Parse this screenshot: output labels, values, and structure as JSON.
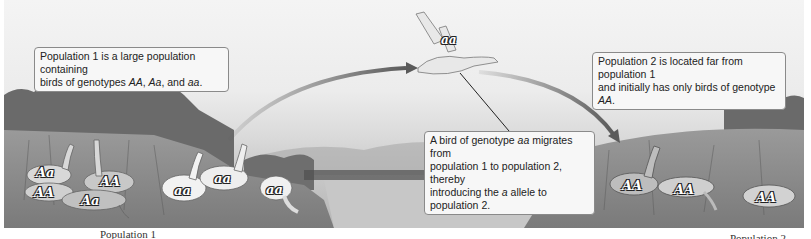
{
  "callouts": {
    "population1": {
      "line1": "Population 1 is a large population containing",
      "line2_prefix": "birds of genotypes ",
      "g1": "AA",
      "sep1": ", ",
      "g2": "Aa",
      "sep2": ", and ",
      "g3": "aa",
      "end": "."
    },
    "population2": {
      "line1": "Population 2 is located far from population 1",
      "line2_prefix": "and initially has only birds of genotype ",
      "g1": "AA",
      "end": "."
    },
    "migration": {
      "line1_prefix": "A bird of genotype ",
      "g1": "aa",
      "line1_suffix": " migrates from",
      "line2": "population 1 to population 2, thereby",
      "line3_prefix": "introducing the ",
      "allele": "a",
      "line3_suffix": " allele to population 2."
    }
  },
  "birds": {
    "flying": {
      "genotype": "aa"
    },
    "population1": [
      {
        "genotype": "Aa"
      },
      {
        "genotype": "AA"
      },
      {
        "genotype": "AA"
      },
      {
        "genotype": "Aa"
      },
      {
        "genotype": "aa"
      },
      {
        "genotype": "aa"
      },
      {
        "genotype": "aa"
      }
    ],
    "population2": [
      {
        "genotype": "AA"
      },
      {
        "genotype": "AA"
      },
      {
        "genotype": "AA"
      }
    ]
  },
  "labels": {
    "population1": "Population 1",
    "population2": "Population 2"
  },
  "colors": {
    "arrow": "#5a5a5a",
    "callout_border": "#8a8a8a",
    "callout_bg": "#f7f7f7"
  }
}
